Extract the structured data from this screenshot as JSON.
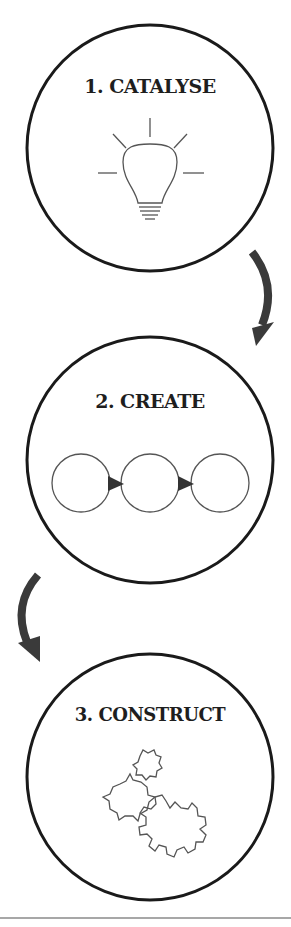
{
  "diagram": {
    "stages": [
      {
        "number": "1",
        "label": "1. CATALYSE",
        "icon": "lightbulb-icon"
      },
      {
        "number": "2",
        "label": "2. CREATE",
        "icon": "iteration-circles-icon"
      },
      {
        "number": "3",
        "label": "3. CONSTRUCT",
        "icon": "gears-icon"
      }
    ],
    "connectors": [
      {
        "from": "1",
        "to": "2",
        "icon": "curved-arrow-down-icon",
        "side": "right"
      },
      {
        "from": "2",
        "to": "3",
        "icon": "curved-arrow-down-icon",
        "side": "left"
      }
    ],
    "colors": {
      "stroke": "#1a1a1a",
      "arrow": "#3a3a3a",
      "icon_stroke": "#555555",
      "rule": "#8a8a8a",
      "background": "#ffffff"
    }
  }
}
